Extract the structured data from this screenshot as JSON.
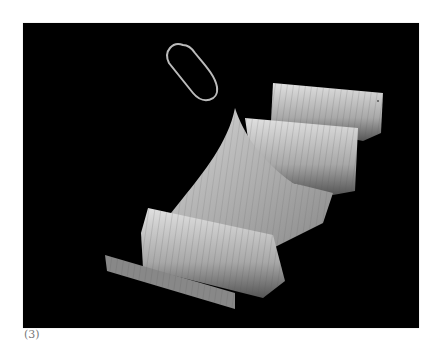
{
  "figure": {
    "background": "#000000",
    "surface_color": "#c8c8c8"
  },
  "caption": "(3)"
}
